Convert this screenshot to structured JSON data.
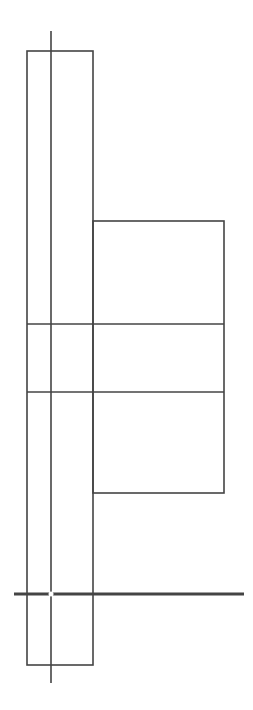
{
  "diagram": {
    "canvas": {
      "width": 253,
      "height": 710,
      "background": "#ffffff"
    },
    "stroke_color": "#444444",
    "tall_rect": {
      "x": 27,
      "y": 51,
      "width": 66,
      "height": 614
    },
    "right_box": {
      "x": 93,
      "y": 221,
      "width": 131,
      "height": 272
    },
    "vertical_axis": {
      "x": 51,
      "y1": 31,
      "y2": 683
    },
    "horizontal_lines": [
      {
        "y": 324,
        "x1": 27,
        "x2": 224
      },
      {
        "y": 392,
        "x1": 27,
        "x2": 224
      }
    ],
    "baseline": {
      "y": 594,
      "x1": 14,
      "x2": 244,
      "thickness": 3
    },
    "intersection_marker": {
      "x": 51,
      "y": 594,
      "color": "#ffffff"
    }
  }
}
